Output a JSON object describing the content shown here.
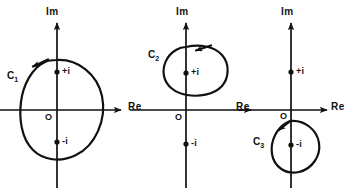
{
  "figure": {
    "background_color": "#ffffff",
    "ink_color": "#111111"
  },
  "panels": [
    {
      "id": "panel-1",
      "axes": {
        "imaginary_label": "Im",
        "real_label": "Re",
        "origin_label": "O"
      },
      "points": [
        {
          "name": "plus-i",
          "label": "+i"
        },
        {
          "name": "minus-i",
          "label": "-i"
        }
      ],
      "contour": {
        "name": "C1",
        "label": "C",
        "subscript": "1",
        "direction": "counterclockwise",
        "encloses": [
          "+i",
          "-i",
          "O"
        ]
      }
    },
    {
      "id": "panel-2",
      "axes": {
        "imaginary_label": "Im",
        "real_label": "Re",
        "origin_label": "O"
      },
      "points": [
        {
          "name": "plus-i",
          "label": "+i"
        },
        {
          "name": "minus-i",
          "label": "-i"
        }
      ],
      "contour": {
        "name": "C2",
        "label": "C",
        "subscript": "2",
        "direction": "counterclockwise",
        "encloses": [
          "+i"
        ]
      }
    },
    {
      "id": "panel-3",
      "axes": {
        "imaginary_label": "Im",
        "real_label": "Re",
        "origin_label": "O"
      },
      "points": [
        {
          "name": "plus-i",
          "label": "+i"
        },
        {
          "name": "minus-i",
          "label": "-i"
        }
      ],
      "contour": {
        "name": "C3",
        "label": "C",
        "subscript": "3",
        "direction": "counterclockwise",
        "encloses": [
          "-i"
        ]
      }
    }
  ]
}
